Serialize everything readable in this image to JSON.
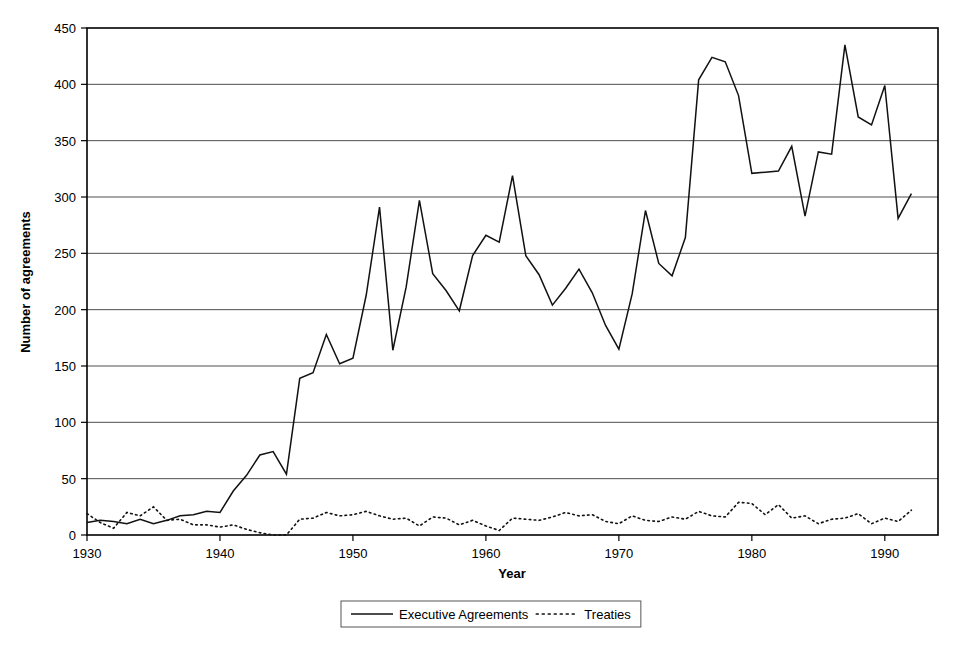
{
  "chart_data": {
    "type": "line",
    "title": "",
    "xlabel": "Year",
    "ylabel": "Number of agreements",
    "xlim": [
      1930,
      1994
    ],
    "ylim": [
      0,
      450
    ],
    "xticks": [
      1930,
      1940,
      1950,
      1960,
      1970,
      1980,
      1990
    ],
    "xtick_labels": [
      "1930",
      "1940",
      "1950",
      "1960",
      "1970",
      "1980",
      "1990"
    ],
    "yticks": [
      0,
      50,
      100,
      150,
      200,
      250,
      300,
      350,
      400,
      450
    ],
    "ytick_labels": [
      "0",
      "50",
      "100",
      "150",
      "200",
      "250",
      "300",
      "350",
      "400",
      "450"
    ],
    "grid": "horizontal",
    "legend_position": "bottom-center",
    "legend_entries": [
      "Executive Agreements",
      "Treaties"
    ],
    "x": [
      1930,
      1931,
      1932,
      1933,
      1934,
      1935,
      1936,
      1937,
      1938,
      1939,
      1940,
      1941,
      1942,
      1943,
      1944,
      1945,
      1946,
      1947,
      1948,
      1949,
      1950,
      1951,
      1952,
      1953,
      1954,
      1955,
      1956,
      1957,
      1958,
      1959,
      1960,
      1961,
      1962,
      1963,
      1964,
      1965,
      1966,
      1967,
      1968,
      1969,
      1970,
      1971,
      1972,
      1973,
      1974,
      1975,
      1976,
      1977,
      1978,
      1979,
      1980,
      1981,
      1982,
      1983,
      1984,
      1985,
      1986,
      1987,
      1988,
      1989,
      1990,
      1991,
      1992
    ],
    "series": [
      {
        "name": "Executive Agreements",
        "style": "solid",
        "values": [
          11,
          13,
          12,
          10,
          14,
          10,
          13,
          17,
          18,
          21,
          20,
          39,
          53,
          71,
          74,
          54,
          139,
          144,
          178,
          152,
          157,
          213,
          291,
          164,
          220,
          297,
          232,
          217,
          199,
          248,
          266,
          260,
          319,
          248,
          231,
          204,
          219,
          236,
          215,
          186,
          165,
          214,
          288,
          241,
          230,
          264,
          404,
          424,
          420,
          390,
          321,
          322,
          323,
          345,
          283,
          340,
          338,
          435,
          371,
          364,
          399,
          281,
          303
        ]
      },
      {
        "name": "Treaties",
        "style": "dotted",
        "values": [
          19,
          11,
          6,
          20,
          17,
          25,
          13,
          14,
          9,
          9,
          7,
          9,
          5,
          2,
          0,
          0,
          14,
          15,
          20,
          17,
          18,
          21,
          17,
          14,
          15,
          8,
          16,
          15,
          9,
          13,
          8,
          4,
          15,
          14,
          13,
          16,
          20,
          17,
          18,
          12,
          10,
          17,
          13,
          12,
          16,
          14,
          21,
          17,
          16,
          29,
          28,
          18,
          27,
          15,
          17,
          10,
          14,
          15,
          19,
          10,
          15,
          12,
          22
        ]
      }
    ]
  }
}
